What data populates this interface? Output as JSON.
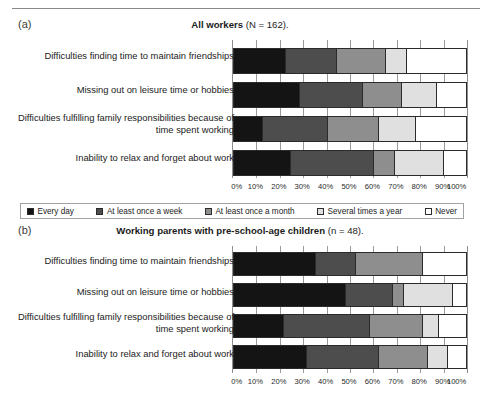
{
  "runhead": {
    "text": "",
    "page": ""
  },
  "legend": {
    "items": [
      {
        "label": "Every day",
        "color": "#141414"
      },
      {
        "label": "At least once a week",
        "color": "#4d4d4d"
      },
      {
        "label": "At least once a month",
        "color": "#8e8e8e"
      },
      {
        "label": "Several times a year",
        "color": "#e0e0e0"
      },
      {
        "label": "Never",
        "color": "#ffffff"
      }
    ]
  },
  "axis": {
    "ticks": [
      "0%",
      "10%",
      "20%",
      "30%",
      "40%",
      "50%",
      "60%",
      "70%",
      "80%",
      "90%",
      "100%"
    ]
  },
  "panels": [
    {
      "letter": "(a)",
      "title_bold": "All workers",
      "title_paren": " (N = 162)."
    },
    {
      "letter": "(b)",
      "title_bold": "Working parents with pre-school-age children",
      "title_paren": " (n = 48)."
    }
  ],
  "chart_data": [
    {
      "type": "bar",
      "orientation": "horizontal",
      "stacked": true,
      "normalized": true,
      "title": "All workers (N = 162).",
      "panel": "(a)",
      "xlabel": "",
      "ylabel": "",
      "xlim": [
        0,
        100
      ],
      "xticks": [
        0,
        10,
        20,
        30,
        40,
        50,
        60,
        70,
        80,
        90,
        100
      ],
      "grid": true,
      "legend_position": "bottom",
      "categories": [
        "Difficulties finding time to maintain friendships",
        "Missing out on leisure time or hobbies",
        "Difficulties fulfilling family responsibilities because of time spent working",
        "Inability to relax and forget about work"
      ],
      "series": [
        {
          "name": "Every day",
          "color": "#141414",
          "values": [
            22,
            28,
            12,
            24
          ]
        },
        {
          "name": "At least once a week",
          "color": "#4d4d4d",
          "values": [
            22,
            27,
            28,
            36
          ]
        },
        {
          "name": "At least once a month",
          "color": "#8e8e8e",
          "values": [
            21,
            17,
            22,
            9
          ]
        },
        {
          "name": "Several times a year",
          "color": "#e0e0e0",
          "values": [
            9,
            15,
            16,
            21
          ]
        },
        {
          "name": "Never",
          "color": "#ffffff",
          "values": [
            26,
            13,
            22,
            10
          ]
        }
      ]
    },
    {
      "type": "bar",
      "orientation": "horizontal",
      "stacked": true,
      "normalized": true,
      "title": "Working parents with pre-school-age children (n = 48).",
      "panel": "(b)",
      "xlabel": "",
      "ylabel": "",
      "xlim": [
        0,
        100
      ],
      "xticks": [
        0,
        10,
        20,
        30,
        40,
        50,
        60,
        70,
        80,
        90,
        100
      ],
      "grid": true,
      "legend_position": "bottom",
      "categories": [
        "Difficulties finding time to maintain friendships",
        "Missing out on leisure time or hobbies",
        "Difficulties fulfilling family responsibilities because of time spent working",
        "Inability to relax and forget about work"
      ],
      "series": [
        {
          "name": "Every day",
          "color": "#141414",
          "values": [
            35,
            48,
            21,
            31
          ]
        },
        {
          "name": "At least once a week",
          "color": "#4d4d4d",
          "values": [
            17,
            20,
            37,
            31
          ]
        },
        {
          "name": "At least once a month",
          "color": "#8e8e8e",
          "values": [
            29,
            5,
            23,
            21
          ]
        },
        {
          "name": "Several times a year",
          "color": "#e0e0e0",
          "values": [
            0,
            21,
            7,
            9
          ]
        },
        {
          "name": "Never",
          "color": "#ffffff",
          "values": [
            19,
            6,
            12,
            8
          ]
        }
      ]
    }
  ],
  "layout": {
    "panel_a": {
      "rows": [
        {
          "top": 8,
          "height": 26
        },
        {
          "top": 42,
          "height": 26
        },
        {
          "top": 76,
          "height": 26
        },
        {
          "top": 110,
          "height": 26
        }
      ],
      "label_tops": [
        10,
        44,
        72,
        112
      ]
    },
    "panel_b": {
      "rows": [
        {
          "top": 6,
          "height": 24
        },
        {
          "top": 37,
          "height": 24
        },
        {
          "top": 68,
          "height": 24
        },
        {
          "top": 99,
          "height": 24
        }
      ],
      "label_tops": [
        9,
        40,
        65,
        102
      ]
    }
  }
}
